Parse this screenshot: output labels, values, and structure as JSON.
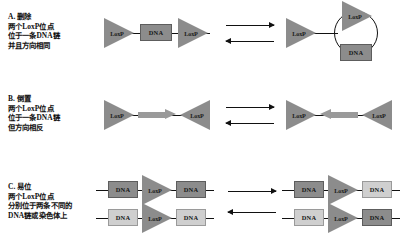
{
  "figure": {
    "labels": {
      "loxp": "LoxP",
      "dna": "DNA"
    },
    "panels": [
      {
        "id": "A",
        "caption_lines": [
          "A. 删除",
          "两个LoxP位点",
          "位于一条DNA链",
          "并且方向相同"
        ],
        "mechanism": "deletion",
        "substrate": "linear DNA with two same-direction LoxP sites flanking a DNA segment",
        "product": "linear DNA with one LoxP site plus excised circular DNA carrying one LoxP site"
      },
      {
        "id": "B",
        "caption_lines": [
          "B. 倒置",
          "两个LoxP位点",
          "位于一条DNA链",
          "但方向相反"
        ],
        "mechanism": "inversion",
        "substrate": "linear DNA with two opposite-direction LoxP sites flanking a rightward segment",
        "product": "same linear DNA with the intervening segment inverted to point leftward"
      },
      {
        "id": "C",
        "caption_lines": [
          "C. 易位",
          "两个LoxP位点",
          "分别位于两条不同的",
          "DNA链或染色体上"
        ],
        "mechanism": "translocation",
        "substrate": "two separate DNA strands, each carrying one LoxP site between DNA segments",
        "product": "two recombined strands with DNA segments exchanged between strands"
      }
    ],
    "colors": {
      "loxp_fill": "#8c8c8c",
      "dna_dark": "#8c8c8c",
      "dna_light": "#cfcfcf",
      "stroke": "#111111",
      "background": "#ffffff"
    },
    "arrows": {
      "forward": "forward-reaction-arrow",
      "reverse": "reverse-reaction-arrow"
    }
  }
}
